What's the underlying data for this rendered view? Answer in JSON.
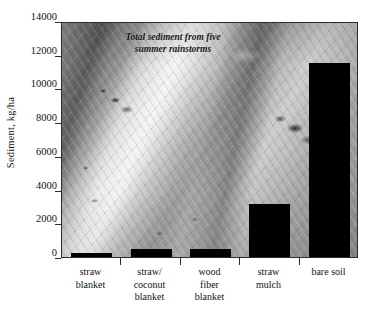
{
  "chart_data": {
    "type": "bar",
    "title": "",
    "annotation": "Total sediment from five summer rainstorms",
    "annotation_lines": [
      "Total sediment from five",
      "summer rainstorms"
    ],
    "xlabel": "",
    "ylabel": "Sediment, kg/ha",
    "categories": [
      "straw blanket",
      "straw/ coconut blanket",
      "wood fiber blanket",
      "straw mulch",
      "bare soil"
    ],
    "category_lines": [
      [
        "straw",
        "blanket"
      ],
      [
        "straw/",
        "coconut",
        "blanket"
      ],
      [
        "wood",
        "fiber",
        "blanket"
      ],
      [
        "straw",
        "mulch"
      ],
      [
        "bare soil"
      ]
    ],
    "values": [
      240,
      480,
      500,
      3150,
      11500
    ],
    "ylim": [
      0,
      14000
    ],
    "ytick_values": [
      0,
      2000,
      4000,
      6000,
      8000,
      10000,
      12000,
      14000
    ],
    "ytick_labels": [
      "0",
      "2000",
      "4000",
      "6000",
      "8000",
      "10000",
      "12000",
      "14000"
    ],
    "grid": false,
    "legend": null,
    "bar_color": "#000000",
    "background_description": "grayscale photograph of straw erosion-control blanket fibers"
  }
}
